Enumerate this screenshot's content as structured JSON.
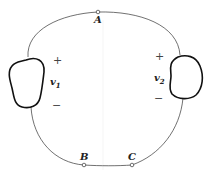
{
  "diagram": {
    "nodes": [
      {
        "id": "A",
        "label": "A"
      },
      {
        "id": "B",
        "label": "B"
      },
      {
        "id": "C",
        "label": "C"
      }
    ],
    "sources": [
      {
        "id": "v1",
        "symbol": "v",
        "subscript": "1",
        "plus": "+",
        "minus": "−"
      },
      {
        "id": "v2",
        "symbol": "v",
        "subscript": "2",
        "plus": "+",
        "minus": "−"
      }
    ]
  }
}
